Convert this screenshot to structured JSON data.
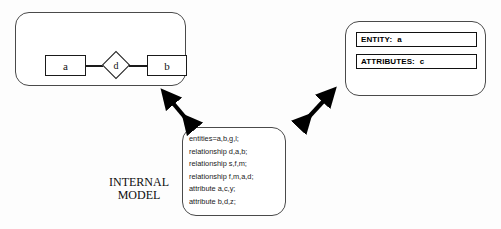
{
  "diagram": {
    "background_color": "#fdfdfd",
    "line_color": "#1a1a1a"
  },
  "conceptual_panel": {
    "name": "conceptual-model",
    "entity_a": "a",
    "entity_b": "b",
    "relationship": "d"
  },
  "logical_panel": {
    "name": "logical-model",
    "rows": [
      {
        "label": "ENTITY:",
        "value": "a"
      },
      {
        "label": "ATTRIBUTES:",
        "value": "c"
      }
    ]
  },
  "internal_panel": {
    "name": "internal-model",
    "caption_line1": "INTERNAL",
    "caption_line2": "MODEL",
    "code_lines": [
      "entities=a,b,g,l;",
      "relationship d,a,b;",
      "relationship s,f,m;",
      "relationship f,m,a,d;",
      "attribute a,c,y;",
      "attribute b,d,z;"
    ]
  },
  "arrows": {
    "left": "double-headed-arrow",
    "right": "double-headed-arrow"
  }
}
